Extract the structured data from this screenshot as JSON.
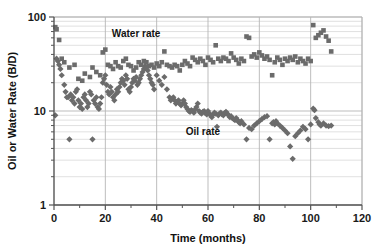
{
  "chart_data": {
    "type": "scatter",
    "title": "",
    "xlabel": "Time (months)",
    "ylabel": "Oil or Water Rate (B/D)",
    "xlim": [
      0,
      120
    ],
    "ylim": [
      1,
      100
    ],
    "yscale": "log",
    "xscale": "linear",
    "grid": true,
    "legend_position": "inline-annotations",
    "xticks": [
      0,
      20,
      40,
      60,
      80,
      100,
      120
    ],
    "xtick_labels": [
      "0",
      "20",
      "40",
      "60",
      "80",
      "100",
      "120"
    ],
    "xticks_minor": [
      10,
      30,
      50,
      70,
      90,
      110
    ],
    "yticks": [
      1,
      10,
      100
    ],
    "ytick_labels": [
      "1",
      "10",
      "100"
    ],
    "yticks_minor": [
      2,
      3,
      4,
      5,
      6,
      7,
      8,
      9,
      20,
      30,
      40,
      50,
      60,
      70,
      80,
      90
    ],
    "marker_color": "#6b6b6b",
    "series": [
      {
        "name": "Water rate",
        "marker": "square",
        "color": "#6b6b6b",
        "annotation": "Water rate",
        "annotation_x": 32,
        "annotation_y": 62,
        "points": [
          [
            0.5,
            78
          ],
          [
            1.0,
            74
          ],
          [
            2.0,
            57
          ],
          [
            3.0,
            36
          ],
          [
            4.0,
            33
          ],
          [
            6.0,
            29
          ],
          [
            8.0,
            31
          ],
          [
            9.5,
            22
          ],
          [
            11.0,
            21
          ],
          [
            12.0,
            25
          ],
          [
            14.0,
            23
          ],
          [
            15.0,
            29
          ],
          [
            16.5,
            26
          ],
          [
            18.0,
            24
          ],
          [
            19.0,
            42
          ],
          [
            20.0,
            45
          ],
          [
            21.0,
            31
          ],
          [
            22.0,
            30
          ],
          [
            23.0,
            28
          ],
          [
            24.0,
            33
          ],
          [
            25.0,
            30
          ],
          [
            26.0,
            29
          ],
          [
            27.0,
            34
          ],
          [
            28.0,
            36
          ],
          [
            29.0,
            31
          ],
          [
            30.0,
            30
          ],
          [
            31.0,
            27
          ],
          [
            32.0,
            29
          ],
          [
            33.0,
            33
          ],
          [
            34.0,
            31
          ],
          [
            35.0,
            34
          ],
          [
            36.0,
            33
          ],
          [
            37.0,
            30
          ],
          [
            38.0,
            31
          ],
          [
            39.0,
            29
          ],
          [
            40.0,
            32
          ],
          [
            41.0,
            30
          ],
          [
            42.0,
            33
          ],
          [
            43.0,
            43
          ],
          [
            44.0,
            31
          ],
          [
            45.0,
            30
          ],
          [
            46.0,
            29
          ],
          [
            47.0,
            31
          ],
          [
            48.0,
            30
          ],
          [
            49.0,
            27
          ],
          [
            50.0,
            31
          ],
          [
            51.0,
            34
          ],
          [
            52.0,
            32
          ],
          [
            53.0,
            30
          ],
          [
            54.0,
            37
          ],
          [
            55.0,
            35
          ],
          [
            56.0,
            33
          ],
          [
            57.0,
            36
          ],
          [
            58.0,
            34
          ],
          [
            59.0,
            31
          ],
          [
            60.0,
            37
          ],
          [
            61.0,
            35
          ],
          [
            62.0,
            33
          ],
          [
            63.0,
            50
          ],
          [
            64.0,
            36
          ],
          [
            65.0,
            34
          ],
          [
            66.0,
            37
          ],
          [
            67.0,
            36
          ],
          [
            68.0,
            34
          ],
          [
            69.0,
            41
          ],
          [
            70.0,
            37
          ],
          [
            71.0,
            35
          ],
          [
            72.0,
            32
          ],
          [
            73.0,
            36
          ],
          [
            74.0,
            34
          ],
          [
            75.0,
            62
          ],
          [
            76.0,
            60
          ],
          [
            77.0,
            38
          ],
          [
            78.0,
            40
          ],
          [
            79.0,
            37
          ],
          [
            80.0,
            42
          ],
          [
            81.0,
            39
          ],
          [
            82.0,
            36
          ],
          [
            83.0,
            38
          ],
          [
            84.0,
            35
          ],
          [
            85.0,
            24
          ],
          [
            86.0,
            33
          ],
          [
            87.0,
            37
          ],
          [
            88.0,
            35
          ],
          [
            89.0,
            31
          ],
          [
            90.0,
            36
          ],
          [
            91.0,
            34
          ],
          [
            92.0,
            37
          ],
          [
            93.0,
            35
          ],
          [
            94.0,
            38
          ],
          [
            95.0,
            33
          ],
          [
            96.0,
            36
          ],
          [
            97.0,
            34
          ],
          [
            98.0,
            32
          ],
          [
            99.0,
            36
          ],
          [
            100.0,
            34
          ],
          [
            101.0,
            82
          ],
          [
            102.0,
            60
          ],
          [
            103.0,
            64
          ],
          [
            104.0,
            68
          ],
          [
            105.0,
            72
          ],
          [
            106.0,
            62
          ],
          [
            107.0,
            56
          ],
          [
            108.0,
            43
          ]
        ]
      },
      {
        "name": "Oil rate",
        "marker": "diamond",
        "color": "#6b6b6b",
        "annotation": "Oil rate",
        "annotation_x": 58,
        "annotation_y": 5.5,
        "points": [
          [
            0.5,
            9.0
          ],
          [
            1.0,
            36
          ],
          [
            1.5,
            34
          ],
          [
            2.0,
            31
          ],
          [
            2.5,
            28
          ],
          [
            3.0,
            24
          ],
          [
            4.0,
            19
          ],
          [
            4.5,
            16
          ],
          [
            5.0,
            14
          ],
          [
            5.5,
            14
          ],
          [
            6.0,
            5.0
          ],
          [
            6.5,
            15
          ],
          [
            7.0,
            13
          ],
          [
            7.5,
            14
          ],
          [
            8.0,
            12
          ],
          [
            8.5,
            16
          ],
          [
            9.0,
            17
          ],
          [
            9.5,
            13
          ],
          [
            10.0,
            11
          ],
          [
            10.5,
            12
          ],
          [
            11.0,
            10.5
          ],
          [
            11.5,
            14
          ],
          [
            12.0,
            15
          ],
          [
            12.5,
            13
          ],
          [
            13.0,
            11
          ],
          [
            13.5,
            12
          ],
          [
            14.0,
            16
          ],
          [
            14.5,
            15
          ],
          [
            15.0,
            5.0
          ],
          [
            15.5,
            13
          ],
          [
            16.0,
            12
          ],
          [
            16.5,
            14
          ],
          [
            17.0,
            11
          ],
          [
            17.5,
            10.5
          ],
          [
            18.0,
            12
          ],
          [
            18.5,
            14
          ],
          [
            19.0,
            20
          ],
          [
            19.5,
            22
          ],
          [
            20.0,
            24
          ],
          [
            20.5,
            19
          ],
          [
            21.0,
            16
          ],
          [
            21.5,
            15
          ],
          [
            22.0,
            18
          ],
          [
            22.5,
            16
          ],
          [
            23.0,
            14
          ],
          [
            23.5,
            13
          ],
          [
            24.0,
            15
          ],
          [
            24.5,
            17
          ],
          [
            25.0,
            16
          ],
          [
            25.5,
            18
          ],
          [
            26.0,
            20
          ],
          [
            26.5,
            22
          ],
          [
            27.0,
            21
          ],
          [
            27.5,
            19
          ],
          [
            28.0,
            24
          ],
          [
            28.5,
            22
          ],
          [
            29.0,
            17
          ],
          [
            29.5,
            16
          ],
          [
            30.0,
            18
          ],
          [
            30.5,
            20
          ],
          [
            31.0,
            22
          ],
          [
            31.5,
            21
          ],
          [
            32.0,
            23
          ],
          [
            32.5,
            19
          ],
          [
            33.0,
            20
          ],
          [
            33.5,
            22
          ],
          [
            34.0,
            24
          ],
          [
            34.5,
            26
          ],
          [
            35.0,
            28
          ],
          [
            35.5,
            30
          ],
          [
            36.0,
            29
          ],
          [
            36.5,
            27
          ],
          [
            37.0,
            24
          ],
          [
            37.5,
            22
          ],
          [
            38.0,
            20
          ],
          [
            38.5,
            19
          ],
          [
            39.0,
            17
          ],
          [
            40.0,
            24
          ],
          [
            41.0,
            21
          ],
          [
            42.0,
            19
          ],
          [
            43.0,
            23
          ],
          [
            44.0,
            17
          ],
          [
            45.0,
            14
          ],
          [
            45.5,
            13
          ],
          [
            46.0,
            13.5
          ],
          [
            46.5,
            14
          ],
          [
            47.0,
            13
          ],
          [
            47.5,
            12
          ],
          [
            48.0,
            12.5
          ],
          [
            48.5,
            13
          ],
          [
            49.0,
            12
          ],
          [
            49.5,
            11.5
          ],
          [
            50.0,
            12
          ],
          [
            50.5,
            13
          ],
          [
            51.0,
            12
          ],
          [
            51.5,
            11
          ],
          [
            52.0,
            10.5
          ],
          [
            52.5,
            10
          ],
          [
            53.0,
            9.8
          ],
          [
            53.5,
            10.2
          ],
          [
            54.0,
            10
          ],
          [
            54.5,
            9.6
          ],
          [
            55.0,
            10.4
          ],
          [
            55.5,
            11
          ],
          [
            56.0,
            12
          ],
          [
            56.5,
            10
          ],
          [
            57.0,
            9.6
          ],
          [
            57.5,
            9.4
          ],
          [
            58.0,
            9.8
          ],
          [
            58.5,
            10
          ],
          [
            59.0,
            9.5
          ],
          [
            59.5,
            9.2
          ],
          [
            60.0,
            10
          ],
          [
            60.5,
            9.4
          ],
          [
            61.0,
            9.0
          ],
          [
            61.5,
            8.6
          ],
          [
            62.0,
            9.2
          ],
          [
            62.5,
            9.6
          ],
          [
            63.0,
            9.4
          ],
          [
            63.5,
            6.8
          ],
          [
            64.0,
            9.0
          ],
          [
            64.5,
            9.4
          ],
          [
            65.0,
            9.6
          ],
          [
            65.5,
            9.2
          ],
          [
            66.0,
            9.0
          ],
          [
            66.5,
            9.5
          ],
          [
            67.0,
            9.8
          ],
          [
            67.5,
            9.4
          ],
          [
            68.0,
            9.0
          ],
          [
            68.5,
            8.6
          ],
          [
            69.0,
            8.8
          ],
          [
            69.5,
            8.4
          ],
          [
            70.0,
            8.2
          ],
          [
            70.5,
            8.0
          ],
          [
            71.0,
            8.4
          ],
          [
            71.5,
            8.0
          ],
          [
            72.0,
            7.6
          ],
          [
            72.5,
            7.4
          ],
          [
            73.0,
            7.8
          ],
          [
            74.0,
            7.2
          ],
          [
            75.0,
            5.0
          ],
          [
            76.0,
            6.6
          ],
          [
            77.0,
            6.4
          ],
          [
            78.0,
            7.0
          ],
          [
            79.0,
            7.4
          ],
          [
            80.0,
            7.8
          ],
          [
            81.0,
            8.2
          ],
          [
            82.0,
            8.6
          ],
          [
            83.0,
            8.8
          ],
          [
            84.0,
            5.0
          ],
          [
            85.0,
            7.4
          ],
          [
            85.5,
            7.6
          ],
          [
            86.0,
            7.2
          ],
          [
            86.5,
            7.8
          ],
          [
            87.0,
            7.4
          ],
          [
            88.0,
            7.0
          ],
          [
            89.0,
            6.6
          ],
          [
            90.0,
            6.2
          ],
          [
            91.0,
            5.8
          ],
          [
            92.0,
            4.2
          ],
          [
            93.0,
            3.1
          ],
          [
            94.0,
            5.4
          ],
          [
            95.0,
            5.8
          ],
          [
            96.0,
            6.2
          ],
          [
            97.0,
            6.8
          ],
          [
            98.0,
            6.4
          ],
          [
            99.0,
            5.0
          ],
          [
            100.0,
            7.2
          ],
          [
            101.0,
            10.6
          ],
          [
            101.5,
            10.2
          ],
          [
            102.0,
            8.4
          ],
          [
            103.0,
            7.6
          ],
          [
            103.5,
            7.2
          ],
          [
            104.0,
            7.0
          ],
          [
            105.0,
            7.4
          ],
          [
            106.0,
            7.0
          ],
          [
            107.0,
            6.9
          ],
          [
            108.0,
            7.0
          ]
        ]
      }
    ]
  }
}
